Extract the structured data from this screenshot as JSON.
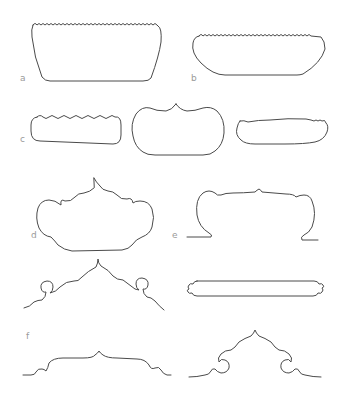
{
  "figure": {
    "labels": {
      "a": "a",
      "b": "b",
      "c": "c",
      "d": "d",
      "e": "e",
      "f": "f"
    },
    "stroke_color": "#4a4a4a",
    "label_color": "#9a9a9a",
    "background": "#ffffff",
    "shapes": [
      {
        "id": "a",
        "description": "trapezoidal outline with scalloped top edge"
      },
      {
        "id": "b",
        "description": "elongated rounded outline with scalloped top edge"
      },
      {
        "id": "c-left",
        "description": "rounded rectangle with scalloped top edge"
      },
      {
        "id": "c-middle",
        "description": "rounded lobed outline with central peak"
      },
      {
        "id": "c-right",
        "description": "flattened rounded outline with small scallops at ends"
      },
      {
        "id": "d",
        "description": "cloud-collar outline with lobes and central ogee point"
      },
      {
        "id": "e",
        "description": "arched canopy outline with scrolled feet and baseline extensions"
      },
      {
        "id": "f-top-left",
        "description": "ogee arch profile with spiral scroll volutes"
      },
      {
        "id": "f-bar",
        "description": "long bar outline with notched scroll ends"
      },
      {
        "id": "f-bottom-left",
        "description": "low ogee arch profile with small curled ends"
      },
      {
        "id": "f-bottom-right",
        "description": "ogee arch profile with inward spiral scrolls"
      }
    ]
  }
}
